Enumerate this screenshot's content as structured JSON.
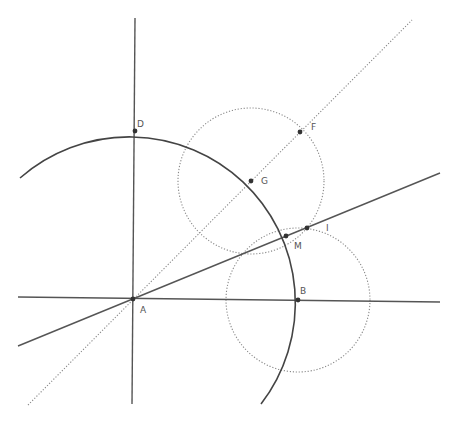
{
  "diagram": {
    "colors": {
      "solid": "#555555",
      "arc": "#444444",
      "dotted": "#888888",
      "point": "#333333",
      "label": "#555555"
    },
    "points": [
      {
        "id": "A",
        "label": "A",
        "x": 133,
        "y": 299,
        "lx": 140,
        "ly": 313
      },
      {
        "id": "B",
        "label": "B",
        "x": 298,
        "y": 300,
        "lx": 300,
        "ly": 294
      },
      {
        "id": "D",
        "label": "D",
        "x": 135,
        "y": 131,
        "lx": 137,
        "ly": 127
      },
      {
        "id": "F",
        "label": "F",
        "x": 300,
        "y": 132,
        "lx": 311,
        "ly": 130
      },
      {
        "id": "G",
        "label": "G",
        "x": 251,
        "y": 181,
        "lx": 261,
        "ly": 184
      },
      {
        "id": "M",
        "label": "M",
        "x": 286,
        "y": 236,
        "lx": 294,
        "ly": 249
      },
      {
        "id": "I",
        "label": "I",
        "x": 307,
        "y": 228,
        "lx": 326,
        "ly": 231
      }
    ],
    "lines": [
      {
        "id": "horizontal-axis",
        "style": "solid",
        "x1": 18,
        "y1": 297,
        "x2": 440,
        "y2": 302
      },
      {
        "id": "vertical-axis",
        "style": "solid",
        "x1": 135,
        "y1": 18,
        "x2": 132,
        "y2": 404
      },
      {
        "id": "line-AI",
        "style": "solid",
        "x1": 18,
        "y1": 346,
        "x2": 440,
        "y2": 173
      },
      {
        "id": "line-AF",
        "style": "dotted",
        "x1": 28,
        "y1": 405,
        "x2": 412,
        "y2": 20
      }
    ],
    "arcs": [
      {
        "id": "arc-center-A",
        "style": "solid",
        "cx": 133,
        "cy": 299,
        "r": 166,
        "x1": 20,
        "y1": 178,
        "x2": 261,
        "y2": 404
      }
    ],
    "circles": [
      {
        "id": "circle-center-G",
        "style": "dotted",
        "cx": 251,
        "cy": 181,
        "r": 73
      },
      {
        "id": "circle-center-B",
        "style": "dotted",
        "cx": 298,
        "cy": 300,
        "r": 72
      }
    ]
  }
}
